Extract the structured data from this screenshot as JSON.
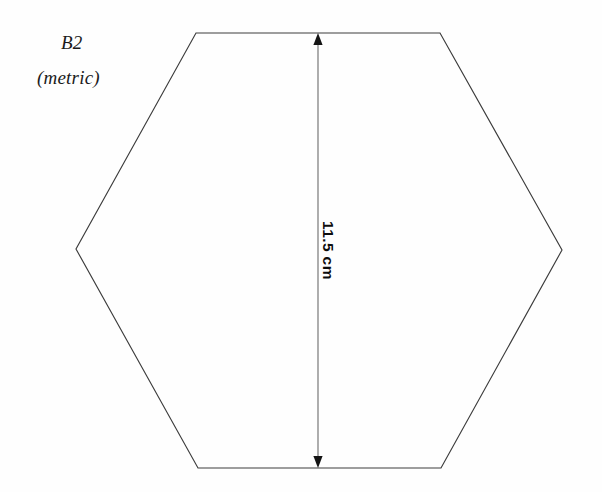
{
  "diagram": {
    "type": "technical-drawing",
    "background_color": "#fefefe",
    "outline_color": "#3c3c3c",
    "dimension_color": "#6b6b6b",
    "canvas": {
      "width": 602,
      "height": 492
    },
    "shape": {
      "name": "hexagon",
      "sides": 6,
      "outline_path": "M 196 33 L 440 33 L 562 250 L 441 468 L 198 468 L 76 249 Z",
      "vertices": [
        {
          "label": "top-left",
          "x": 196,
          "y": 33
        },
        {
          "label": "top-right",
          "x": 440,
          "y": 33
        },
        {
          "label": "right",
          "x": 562,
          "y": 250
        },
        {
          "label": "bottom-right",
          "x": 441,
          "y": 468
        },
        {
          "label": "bottom-left",
          "x": 198,
          "y": 468
        },
        {
          "label": "left",
          "x": 76,
          "y": 249
        }
      ]
    },
    "labels": {
      "code": "B2",
      "units": "(metric)"
    },
    "dimension": {
      "value": "11.5 cm",
      "measure": 11.5,
      "unit": "cm",
      "orientation": "vertical",
      "line_x": 318,
      "line_y_start": 33,
      "line_y_end": 468,
      "arrowheads": "both"
    }
  }
}
